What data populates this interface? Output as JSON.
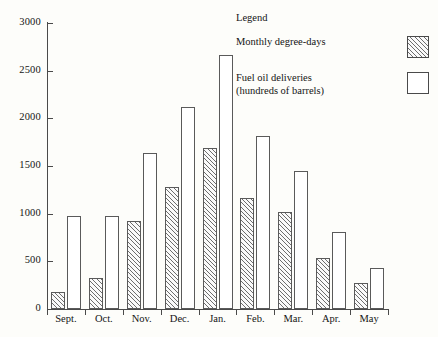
{
  "chart_data": {
    "type": "bar",
    "title": "",
    "xlabel": "",
    "ylabel": "",
    "ylim": [
      0,
      3000
    ],
    "yticks": [
      0,
      500,
      1000,
      1500,
      2000,
      2500,
      3000
    ],
    "grid": false,
    "legend_position": "top-right",
    "categories": [
      "Sept.",
      "Oct.",
      "Nov.",
      "Dec.",
      "Jan.",
      "Feb.",
      "Mar.",
      "Apr.",
      "May"
    ],
    "series": [
      {
        "name": "Monthly degree-days",
        "style": "hatched",
        "values": [
          175,
          330,
          920,
          1280,
          1690,
          1160,
          1020,
          540,
          270
        ]
      },
      {
        "name": "Fuel oil deliveries (hundreds of barrels)",
        "style": "open",
        "values": [
          975,
          975,
          1640,
          2120,
          2660,
          1820,
          1450,
          810,
          430
        ]
      }
    ]
  },
  "legend": {
    "title": "Legend",
    "entries": [
      {
        "label": "Monthly degree-days",
        "swatch": "hatched-square"
      },
      {
        "label": "Fuel oil deliveries\n(hundreds of barrels)",
        "swatch": "open-square"
      }
    ]
  },
  "axes": {
    "y_tick_labels": [
      "0",
      "500",
      "1000",
      "1500",
      "2000",
      "2500",
      "3000"
    ],
    "x_tick_labels": [
      "Sept.",
      "Oct.",
      "Nov.",
      "Dec.",
      "Jan.",
      "Feb.",
      "Mar.",
      "Apr.",
      "May"
    ]
  },
  "colors": {
    "background": "#fdfdfa",
    "axis": "#4a4a4a",
    "bar_outline": "#5a5a5a",
    "hatch": "#6d6d6d",
    "open_fill": "#ffffff",
    "text": "#141414"
  }
}
